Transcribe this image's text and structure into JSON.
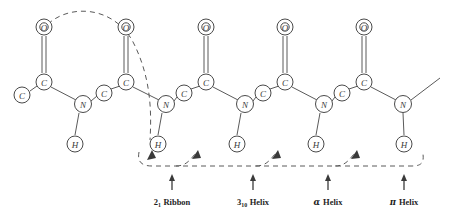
{
  "figure": {
    "background_color": "#ffffff",
    "line_color": "#5a5a5a",
    "text_color": "#1f1f1f",
    "width": 452,
    "height": 215
  },
  "atoms": {
    "oxygen_label": "O",
    "carbon_label": "C",
    "nitrogen_label": "N",
    "hydrogen_label": "H",
    "oxygens": [
      {
        "name": "oxygen-1",
        "label": "O",
        "x": 44,
        "y": 27
      },
      {
        "name": "oxygen-2",
        "label": "O",
        "x": 126,
        "y": 27
      },
      {
        "name": "oxygen-3",
        "label": "O",
        "x": 206,
        "y": 27
      },
      {
        "name": "oxygen-4",
        "label": "O",
        "x": 285,
        "y": 27
      },
      {
        "name": "oxygen-5",
        "label": "O",
        "x": 364,
        "y": 27
      }
    ],
    "carbonyl_carbons": [
      {
        "name": "carbonyl-carbon-1",
        "label": "C",
        "x": 44,
        "y": 82
      },
      {
        "name": "carbonyl-carbon-2",
        "label": "C",
        "x": 126,
        "y": 82
      },
      {
        "name": "carbonyl-carbon-3",
        "label": "C",
        "x": 206,
        "y": 82
      },
      {
        "name": "carbonyl-carbon-4",
        "label": "C",
        "x": 285,
        "y": 82
      },
      {
        "name": "carbonyl-carbon-5",
        "label": "C",
        "x": 364,
        "y": 82
      }
    ],
    "alpha_carbons": [
      {
        "name": "alpha-carbon-0",
        "label": "C",
        "x": 22,
        "y": 95
      },
      {
        "name": "alpha-carbon-1",
        "label": "C",
        "x": 104,
        "y": 93
      },
      {
        "name": "alpha-carbon-2",
        "label": "C",
        "x": 184,
        "y": 93
      },
      {
        "name": "alpha-carbon-3",
        "label": "C",
        "x": 263,
        "y": 93
      },
      {
        "name": "alpha-carbon-4",
        "label": "C",
        "x": 342,
        "y": 93
      }
    ],
    "nitrogens": [
      {
        "name": "nitrogen-1",
        "label": "N",
        "x": 83,
        "y": 104
      },
      {
        "name": "nitrogen-2",
        "label": "N",
        "x": 166,
        "y": 104
      },
      {
        "name": "nitrogen-3",
        "label": "N",
        "x": 245,
        "y": 104
      },
      {
        "name": "nitrogen-4",
        "label": "N",
        "x": 324,
        "y": 104
      },
      {
        "name": "nitrogen-5",
        "label": "N",
        "x": 403,
        "y": 104
      }
    ],
    "hydrogens": [
      {
        "name": "hydrogen-1",
        "label": "H",
        "x": 75,
        "y": 144
      },
      {
        "name": "hydrogen-2",
        "label": "H",
        "x": 158,
        "y": 144
      },
      {
        "name": "hydrogen-3",
        "label": "H",
        "x": 237,
        "y": 144
      },
      {
        "name": "hydrogen-4",
        "label": "H",
        "x": 316,
        "y": 144
      },
      {
        "name": "hydrogen-5",
        "label": "H",
        "x": 404,
        "y": 144
      }
    ]
  },
  "hydrogen_bonds": [
    {
      "name": "hbond-2-1-ribbon",
      "type": "arc-over-top",
      "from": "oxygen-1",
      "to": "hydrogen-2"
    },
    {
      "name": "hbond-3-10-helix",
      "type": "baseline",
      "from": "oxygen-1",
      "to": "hydrogen-3"
    },
    {
      "name": "hbond-alpha-helix",
      "type": "baseline",
      "from": "oxygen-1",
      "to": "hydrogen-4"
    },
    {
      "name": "hbond-pi-helix",
      "type": "baseline",
      "from": "oxygen-1",
      "to": "hydrogen-5"
    }
  ],
  "annotations": [
    {
      "name": "annotation-2-1-ribbon",
      "x": 172,
      "label_main": "Ribbon",
      "prefix": "2",
      "subscript": "1",
      "greek": "",
      "arrow_x": 172,
      "arrow_top": 175,
      "arrow_bottom": 190
    },
    {
      "name": "annotation-3-10-helix",
      "x": 253,
      "label_main": "Helix",
      "prefix": "3",
      "subscript": "10",
      "greek": "",
      "arrow_x": 253,
      "arrow_top": 175,
      "arrow_bottom": 190
    },
    {
      "name": "annotation-alpha-helix",
      "x": 328,
      "label_main": "Helix",
      "prefix": "",
      "subscript": "",
      "greek": "α",
      "arrow_x": 328,
      "arrow_top": 175,
      "arrow_bottom": 190
    },
    {
      "name": "annotation-pi-helix",
      "x": 404,
      "label_main": "Helix",
      "prefix": "",
      "subscript": "",
      "greek": "π",
      "arrow_x": 404,
      "arrow_top": 175,
      "arrow_bottom": 190
    }
  ]
}
